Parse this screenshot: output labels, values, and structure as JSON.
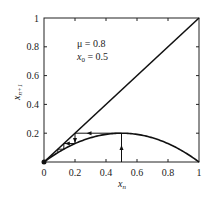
{
  "chart_data": {
    "type": "line",
    "title": "",
    "xlabel": "x_n",
    "ylabel": "x_{n+1}",
    "xlim": [
      0,
      1
    ],
    "ylim": [
      0,
      1
    ],
    "xticks": [
      "0",
      "0.2",
      "0.4",
      "0.6",
      "0.8",
      "1"
    ],
    "yticks": [
      "0.2",
      "0.4",
      "0.6",
      "0.8",
      "1"
    ],
    "grid": false,
    "annotations": [
      "μ = 0.8",
      "x0 = 0.5"
    ],
    "series": [
      {
        "name": "diagonal x_{n+1}=x_n",
        "x": [
          0,
          1
        ],
        "y": [
          0,
          1
        ]
      },
      {
        "name": "map x_{n+1}=μ x_n (1 - x_n)",
        "x": [
          0,
          0.1,
          0.2,
          0.3,
          0.4,
          0.5,
          0.6,
          0.7,
          0.8,
          0.9,
          1
        ],
        "y": [
          0,
          0.072,
          0.128,
          0.168,
          0.192,
          0.2,
          0.192,
          0.168,
          0.128,
          0.072,
          0
        ]
      },
      {
        "name": "cobweb",
        "x": [
          0.5,
          0.5,
          0.2,
          0.2,
          0.128,
          0.128,
          0.089,
          0.089
        ],
        "y": [
          0,
          0.2,
          0.2,
          0.128,
          0.128,
          0.089,
          0.089,
          0.065
        ]
      }
    ],
    "fixed_point": [
      0,
      0
    ]
  },
  "labels": {
    "mu": "μ = 0.8",
    "x0": "x",
    "x0_sub": "0",
    "x0_val": " = 0.5",
    "xlabel": "x",
    "xlabel_sub": "n",
    "ylabel": "x",
    "ylabel_sub": "n+1"
  }
}
